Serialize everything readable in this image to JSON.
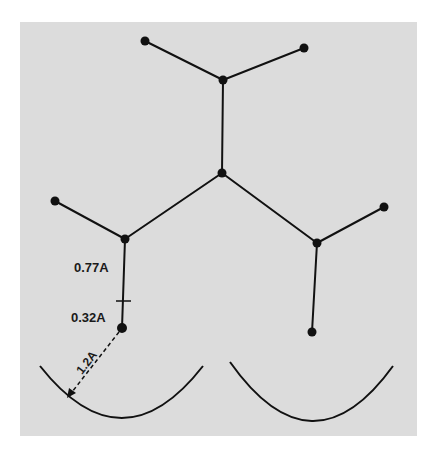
{
  "figure": {
    "background_color": "#dcdcdc",
    "ink_color": "#111111",
    "panel": {
      "x": 20,
      "y": 22,
      "width": 397,
      "height": 414
    }
  },
  "nodes": [
    {
      "id": "top-left-end",
      "x": 145,
      "y": 41
    },
    {
      "id": "top-right-end",
      "x": 304,
      "y": 48
    },
    {
      "id": "upper-junction",
      "x": 223,
      "y": 80
    },
    {
      "id": "center-junction",
      "x": 222,
      "y": 173
    },
    {
      "id": "left-end",
      "x": 55,
      "y": 201
    },
    {
      "id": "left-junction",
      "x": 125,
      "y": 239
    },
    {
      "id": "right-end",
      "x": 384,
      "y": 207
    },
    {
      "id": "right-junction",
      "x": 317,
      "y": 243
    },
    {
      "id": "left-bottom-end",
      "x": 122,
      "y": 328
    },
    {
      "id": "right-bottom-end",
      "x": 312,
      "y": 332
    }
  ],
  "bonds": [
    [
      "top-left-end",
      "upper-junction"
    ],
    [
      "top-right-end",
      "upper-junction"
    ],
    [
      "upper-junction",
      "center-junction"
    ],
    [
      "center-junction",
      "left-junction"
    ],
    [
      "center-junction",
      "right-junction"
    ],
    [
      "left-end",
      "left-junction"
    ],
    [
      "right-end",
      "right-junction"
    ],
    [
      "left-junction",
      "left-bottom-end"
    ],
    [
      "right-junction",
      "right-bottom-end"
    ]
  ],
  "annotations": {
    "bond_length_label": "0.77A",
    "offset_label": "0.32A",
    "radius_label": "1.2A"
  },
  "arcs": [
    {
      "id": "left-arc",
      "path": "M 40 366 Q 122 470 203 366"
    },
    {
      "id": "right-arc",
      "path": "M 230 362 Q 312 478 393 366"
    }
  ]
}
